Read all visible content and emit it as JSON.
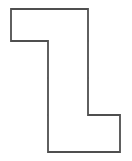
{
  "figure": {
    "shape_name": "hexomino",
    "cell_count": 6,
    "background_color": "#ffffff",
    "outline_color": "#4f4f4f",
    "inner_line_color": "#8a8a8a",
    "line_width": 1.6,
    "geometry": {
      "columns_x": [
        11,
        48,
        88,
        120
      ],
      "rows_y": [
        9,
        41,
        78,
        115,
        152
      ],
      "cell_width_px": 37,
      "cell_height_px": 37
    },
    "cells": [
      {
        "name": "cell-r1c1",
        "row": 1,
        "col": 1,
        "x": 11,
        "y": 9,
        "width": 37,
        "height": 32
      },
      {
        "name": "cell-r1c2",
        "row": 1,
        "col": 2,
        "x": 48,
        "y": 9,
        "width": 40,
        "height": 32
      },
      {
        "name": "cell-r2c2",
        "row": 2,
        "col": 2,
        "x": 48,
        "y": 41,
        "width": 40,
        "height": 37
      },
      {
        "name": "cell-r3c2",
        "row": 3,
        "col": 2,
        "x": 48,
        "y": 78,
        "width": 40,
        "height": 37
      },
      {
        "name": "cell-r4c2",
        "row": 4,
        "col": 2,
        "x": 48,
        "y": 115,
        "width": 40,
        "height": 37
      },
      {
        "name": "cell-r4c3",
        "row": 4,
        "col": 3,
        "x": 88,
        "y": 115,
        "width": 32,
        "height": 37
      }
    ],
    "outline_path": "M 11 9 L 88 9 L 88 115 L 120 115 L 120 152 L 48 152 L 48 41 L 11 41 Z",
    "inner_lines": [
      {
        "name": "inner-vertical-r1",
        "x1": 48,
        "y1": 9,
        "x2": 48,
        "y2": 41
      },
      {
        "name": "inner-horizontal-r1r2",
        "x1": 48,
        "y1": 41,
        "x2": 88,
        "y2": 41
      },
      {
        "name": "inner-horizontal-r2r3",
        "x1": 48,
        "y1": 78,
        "x2": 88,
        "y2": 78
      },
      {
        "name": "inner-horizontal-r3r4",
        "x1": 48,
        "y1": 115,
        "x2": 88,
        "y2": 115
      },
      {
        "name": "inner-vertical-r4",
        "x1": 88,
        "y1": 115,
        "x2": 88,
        "y2": 152
      }
    ]
  }
}
